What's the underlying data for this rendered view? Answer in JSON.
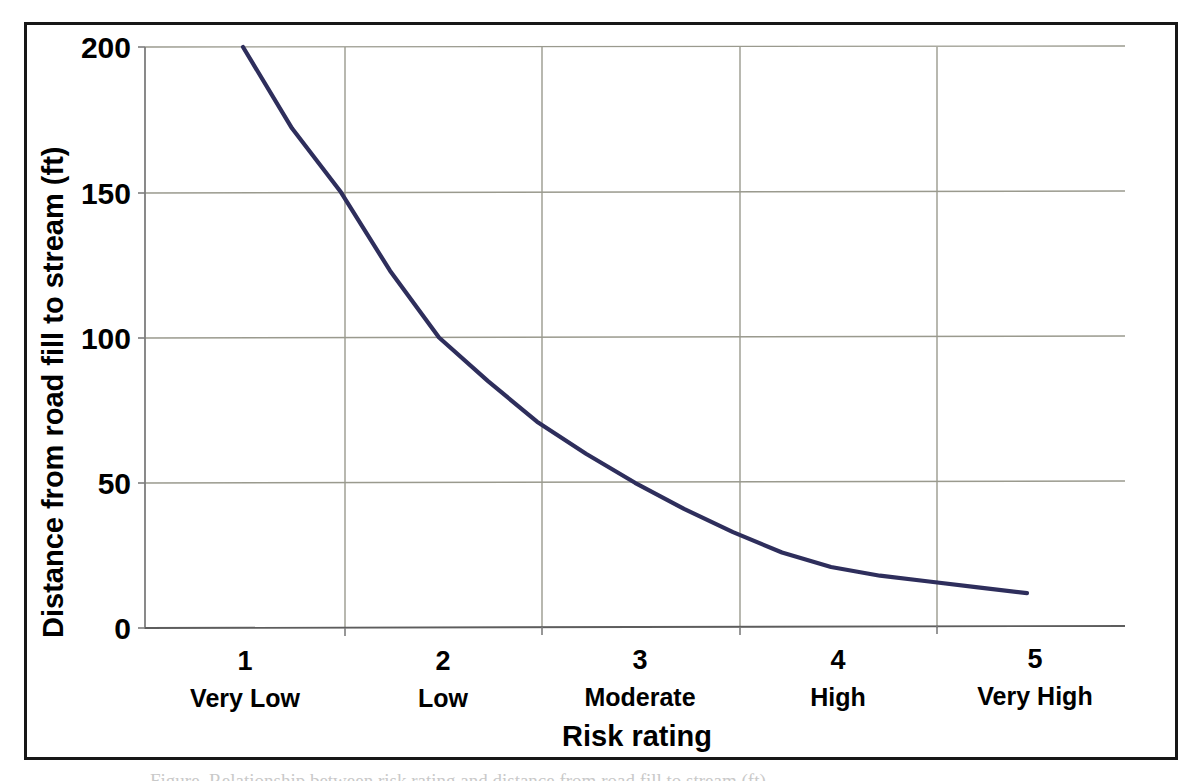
{
  "figure": {
    "caption_partial": "Figure. Relationship between risk rating and distance from road fill to stream (ft).",
    "border_color": "#171717",
    "background_color": "#ffffff"
  },
  "chart_data": {
    "type": "line",
    "title": "",
    "xlabel": "Risk rating",
    "ylabel": "Distance from road fill to stream (ft)",
    "xlim": [
      0.5,
      5.5
    ],
    "ylim": [
      0,
      200
    ],
    "grid": true,
    "legend": "none",
    "series_color": "#2e2e5c",
    "categories": [
      "1",
      "2",
      "3",
      "4",
      "5"
    ],
    "category_labels": [
      "Very Low",
      "Low",
      "Moderate",
      "High",
      "Very High"
    ],
    "x_tick_values": [
      1,
      2,
      3,
      4,
      5
    ],
    "y_ticks": [
      "0",
      "50",
      "100",
      "150",
      "200"
    ],
    "y_tick_values": [
      0,
      50,
      100,
      150,
      200
    ],
    "series": [
      {
        "name": "Distance from road fill to stream",
        "x": [
          1.0,
          1.25,
          1.5,
          1.75,
          2.0,
          2.25,
          2.5,
          2.75,
          3.0,
          3.25,
          3.5,
          3.75,
          4.0,
          4.25,
          4.5,
          4.75,
          5.0
        ],
        "values": [
          200,
          172,
          150,
          123,
          100,
          85,
          71,
          60,
          50,
          41,
          33,
          26,
          21,
          18,
          16,
          14,
          12
        ]
      }
    ],
    "annotations": []
  },
  "axes": {
    "y_axis_title": "Distance from road fill to stream (ft)",
    "x_axis_title": "Risk rating",
    "y_tick_labels": [
      "200",
      "150",
      "100",
      "50",
      "0"
    ],
    "x_tick_numbers": [
      "1",
      "2",
      "3",
      "4",
      "5"
    ],
    "x_tick_names": [
      "Very Low",
      "Low",
      "Moderate",
      "High",
      "Very High"
    ]
  },
  "colors": {
    "curve": "#2e2e5c",
    "gridline": "#9a9a8e",
    "axis": "#8c8c8c",
    "text": "#000000",
    "frame": "#171717"
  }
}
